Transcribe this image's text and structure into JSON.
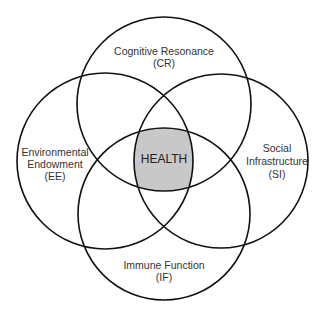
{
  "diagram": {
    "type": "four-circle venn",
    "center": {
      "label": "HEALTH",
      "fill": "#c8c8c8"
    },
    "circles": [
      {
        "id": "CR",
        "lines": [
          "Cognitive Resonance",
          "(CR)"
        ],
        "position": "top"
      },
      {
        "id": "EE",
        "lines": [
          "Environmental",
          "Endowment",
          "(EE)"
        ],
        "position": "left"
      },
      {
        "id": "SI",
        "lines": [
          "Social",
          "Infrastructure",
          "(SI)"
        ],
        "position": "right"
      },
      {
        "id": "IF",
        "lines": [
          "Immune Function",
          "(IF)"
        ],
        "position": "bottom"
      }
    ],
    "stroke_color": "#111111"
  }
}
